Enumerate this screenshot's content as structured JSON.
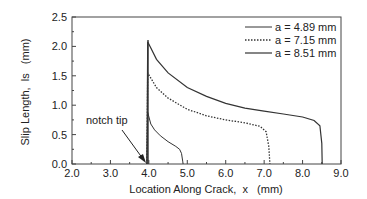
{
  "chart_data": {
    "type": "line",
    "title": "",
    "xlabel": "Location Along Crack,  x   (mm)",
    "ylabel": "Slip Length,  ls   (mm)",
    "xlim": [
      2.0,
      9.0
    ],
    "ylim": [
      0.0,
      2.5
    ],
    "xticks": [
      "2.0",
      "3.0",
      "4.0",
      "5.0",
      "6.0",
      "7.0",
      "8.0",
      "9.0"
    ],
    "yticks": [
      "0.0",
      "0.5",
      "1.0",
      "1.5",
      "2.0",
      "2.5"
    ],
    "grid": false,
    "legend_position": "upper right",
    "annotations": [
      {
        "text": "notch tip",
        "arrow_to": [
          3.95,
          0.0
        ]
      }
    ],
    "series": [
      {
        "name": "a = 4.89 mm",
        "style": "solid-thin",
        "x": [
          3.95,
          3.97,
          4.05,
          4.15,
          4.3,
          4.5,
          4.7,
          4.8,
          4.85,
          4.88,
          4.89
        ],
        "y": [
          0.0,
          0.88,
          0.68,
          0.58,
          0.48,
          0.38,
          0.3,
          0.25,
          0.18,
          0.05,
          0.0
        ]
      },
      {
        "name": "a = 7.15 mm",
        "style": "dotted",
        "x": [
          3.95,
          3.97,
          4.2,
          4.5,
          5.0,
          5.5,
          6.0,
          6.5,
          6.9,
          7.05,
          7.12,
          7.15
        ],
        "y": [
          0.0,
          1.55,
          1.3,
          1.12,
          0.93,
          0.82,
          0.75,
          0.7,
          0.64,
          0.55,
          0.3,
          0.0
        ]
      },
      {
        "name": "a = 8.51 mm",
        "style": "solid",
        "x": [
          3.95,
          3.97,
          4.2,
          4.5,
          5.0,
          5.5,
          6.0,
          6.5,
          7.0,
          7.5,
          8.0,
          8.3,
          8.45,
          8.5,
          8.51
        ],
        "y": [
          0.0,
          2.08,
          1.78,
          1.55,
          1.3,
          1.15,
          1.03,
          0.95,
          0.9,
          0.85,
          0.8,
          0.74,
          0.65,
          0.35,
          0.0
        ]
      }
    ]
  },
  "legend": [
    {
      "label": "a = 4.89 mm",
      "style": "solid-thin"
    },
    {
      "label": "a = 7.15 mm",
      "style": "dotted"
    },
    {
      "label": "a = 8.51 mm",
      "style": "solid"
    }
  ],
  "annotation_text": "notch tip",
  "colors": {
    "line": "#333333",
    "axis": "#444444",
    "text": "#222222"
  }
}
